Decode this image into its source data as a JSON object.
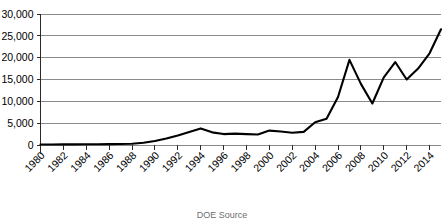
{
  "chart_data": {
    "type": "line",
    "title": "",
    "subtitle": "",
    "xlabel": "",
    "ylabel": "",
    "grid": true,
    "legend": false,
    "legend_position": "none",
    "line_color": "#000000",
    "gridline_color": "#8b8b8b",
    "axis_color": "#2a2a2a",
    "xlim": [
      1980,
      2015
    ],
    "ylim": [
      0,
      30000
    ],
    "ytick_values": [
      0,
      5000,
      10000,
      15000,
      20000,
      25000,
      30000
    ],
    "ytick_labels": [
      "0",
      "5,000",
      "10,000",
      "15,000",
      "20,000",
      "25,000",
      "30,000"
    ],
    "xtick_values": [
      1980,
      1982,
      1984,
      1986,
      1988,
      1990,
      1992,
      1994,
      1996,
      1998,
      2000,
      2002,
      2004,
      2006,
      2008,
      2010,
      2012,
      2014
    ],
    "xtick_labels": [
      "1980",
      "1982",
      "1984",
      "1986",
      "1988",
      "1990",
      "1992",
      "1994",
      "1996",
      "1998",
      "2000",
      "2002",
      "2004",
      "2006",
      "2008",
      "2010",
      "2012",
      "2014"
    ],
    "x": [
      1980,
      1981,
      1982,
      1983,
      1984,
      1985,
      1986,
      1987,
      1988,
      1989,
      1990,
      1991,
      1992,
      1993,
      1994,
      1995,
      1996,
      1997,
      1998,
      1999,
      2000,
      2001,
      2002,
      2003,
      2004,
      2005,
      2006,
      2007,
      2008,
      2009,
      2010,
      2011,
      2012,
      2013,
      2014,
      2015
    ],
    "values": [
      120,
      130,
      140,
      150,
      160,
      170,
      190,
      220,
      300,
      500,
      900,
      1500,
      2200,
      3000,
      3800,
      2900,
      2500,
      2600,
      2500,
      2400,
      3300,
      3100,
      2800,
      3000,
      5200,
      6000,
      11000,
      19500,
      14000,
      9500,
      15500,
      19000,
      15000,
      17500,
      21000,
      26500
    ],
    "series": [
      {
        "name": "series-1",
        "values": [
          120,
          130,
          140,
          150,
          160,
          170,
          190,
          220,
          300,
          500,
          900,
          1500,
          2200,
          3000,
          3800,
          2900,
          2500,
          2600,
          2500,
          2400,
          3300,
          3100,
          2800,
          3000,
          5200,
          6000,
          11000,
          19500,
          14000,
          9500,
          15500,
          19000,
          15000,
          17500,
          21000,
          26500
        ]
      }
    ],
    "annotations": []
  },
  "caption": {
    "text": "DOE Source"
  }
}
